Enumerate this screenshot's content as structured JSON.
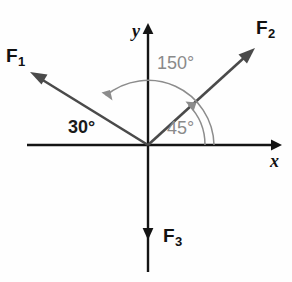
{
  "figure": {
    "type": "vector-force-diagram",
    "background_color": "#fefefe",
    "axis_color": "#141414",
    "vector_color": "#4a4a4a",
    "arc_color": "#8c8c8c",
    "angle_gray_color": "#8a8a8a",
    "angle_dark_color": "#1a1a1a"
  },
  "axes": {
    "x_label": "x",
    "y_label": "y",
    "origin": {
      "x": 148,
      "y": 145
    }
  },
  "vectors": [
    {
      "id": "F1",
      "label": "F",
      "subscript": "1",
      "angle_from_positive_x_deg": 150,
      "direction": "up-left",
      "tip": {
        "x": 33,
        "y": 73
      }
    },
    {
      "id": "F2",
      "label": "F",
      "subscript": "2",
      "angle_from_positive_x_deg": 45,
      "direction": "up-right",
      "tip": {
        "x": 253,
        "y": 48
      }
    },
    {
      "id": "F3",
      "label": "F",
      "subscript": "3",
      "angle_from_positive_x_deg": 270,
      "direction": "down",
      "tip": {
        "x": 148,
        "y": 240
      }
    }
  ],
  "angles": [
    {
      "id": "angle-30",
      "text": "30°",
      "value": 30,
      "unit": "degrees",
      "style": "dark",
      "measured_between": "negative-x-axis and F1"
    },
    {
      "id": "angle-150",
      "text": "150°",
      "value": 150,
      "unit": "degrees",
      "style": "gray",
      "measured_between": "F2 and F1"
    },
    {
      "id": "angle-45",
      "text": "45°",
      "value": 45,
      "unit": "degrees",
      "style": "gray",
      "measured_between": "positive-x-axis and F2"
    }
  ]
}
